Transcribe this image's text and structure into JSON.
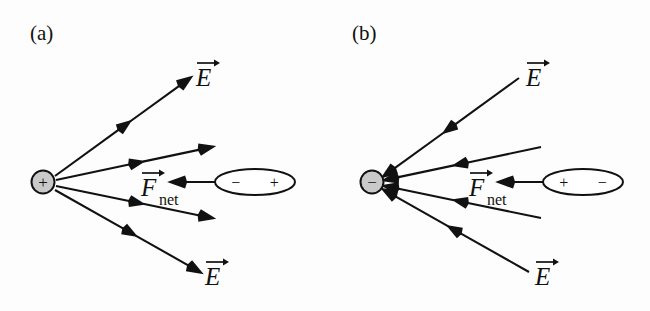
{
  "figure": {
    "background_color": "#fdfdfd",
    "ink_color": "#111111",
    "charge_fill_color": "#c9c9c9"
  },
  "panels": [
    {
      "id": "a",
      "label": "(a)",
      "label_x": 30,
      "label_y": 40,
      "charge": {
        "sign": "+",
        "name": "source-charge-positive",
        "cx": 43,
        "cy": 182,
        "r": 11.5
      },
      "dipole": {
        "name": "dipole-oval",
        "cx": 255,
        "cy": 182,
        "rx": 40,
        "ry": 13,
        "left_pole": "−",
        "right_pole": "+"
      },
      "force_arrow": {
        "name": "net-force-arrow",
        "x1": 215,
        "y1": 182,
        "x2": 172,
        "y2": 182,
        "direction": "left"
      },
      "force_label": {
        "letter": "F",
        "subscript": "net",
        "x": 141,
        "y": 196
      },
      "field_lines": [
        {
          "name": "field-line-upper",
          "x1": 55,
          "y1": 176,
          "x2": 190,
          "y2": 78,
          "direction": "outward"
        },
        {
          "name": "field-line-upper-mid",
          "x1": 56,
          "y1": 180,
          "x2": 212,
          "y2": 147,
          "direction": "outward"
        },
        {
          "name": "field-line-lower-mid",
          "x1": 56,
          "y1": 186,
          "x2": 212,
          "y2": 218,
          "direction": "outward"
        },
        {
          "name": "field-line-lower",
          "x1": 55,
          "y1": 190,
          "x2": 200,
          "y2": 272,
          "direction": "outward"
        }
      ],
      "field_labels": [
        {
          "letter": "E",
          "x": 196,
          "y": 86,
          "name": "field-label-upper"
        },
        {
          "letter": "E",
          "x": 205,
          "y": 285,
          "name": "field-label-lower"
        }
      ]
    },
    {
      "id": "b",
      "label": "(b)",
      "label_x": 352,
      "label_y": 40,
      "charge": {
        "sign": "−",
        "name": "source-charge-negative",
        "cx": 372,
        "cy": 182,
        "r": 11.5
      },
      "dipole": {
        "name": "dipole-oval",
        "cx": 583,
        "cy": 182,
        "rx": 40,
        "ry": 13,
        "left_pole": "+",
        "right_pole": "−"
      },
      "force_arrow": {
        "name": "net-force-arrow",
        "x1": 543,
        "y1": 182,
        "x2": 500,
        "y2": 182,
        "direction": "left"
      },
      "force_label": {
        "letter": "F",
        "subscript": "net",
        "x": 469,
        "y": 196
      },
      "field_lines": [
        {
          "name": "field-line-upper",
          "x1": 519,
          "y1": 78,
          "x2": 384,
          "y2": 176,
          "direction": "inward"
        },
        {
          "name": "field-line-upper-mid",
          "x1": 541,
          "y1": 147,
          "x2": 385,
          "y2": 180,
          "direction": "inward"
        },
        {
          "name": "field-line-lower-mid",
          "x1": 541,
          "y1": 218,
          "x2": 385,
          "y2": 186,
          "direction": "inward"
        },
        {
          "name": "field-line-lower",
          "x1": 529,
          "y1": 272,
          "x2": 384,
          "y2": 190,
          "direction": "inward"
        }
      ],
      "field_labels": [
        {
          "letter": "E",
          "x": 526,
          "y": 86,
          "name": "field-label-upper"
        },
        {
          "letter": "E",
          "x": 535,
          "y": 285,
          "name": "field-label-lower"
        }
      ]
    }
  ]
}
